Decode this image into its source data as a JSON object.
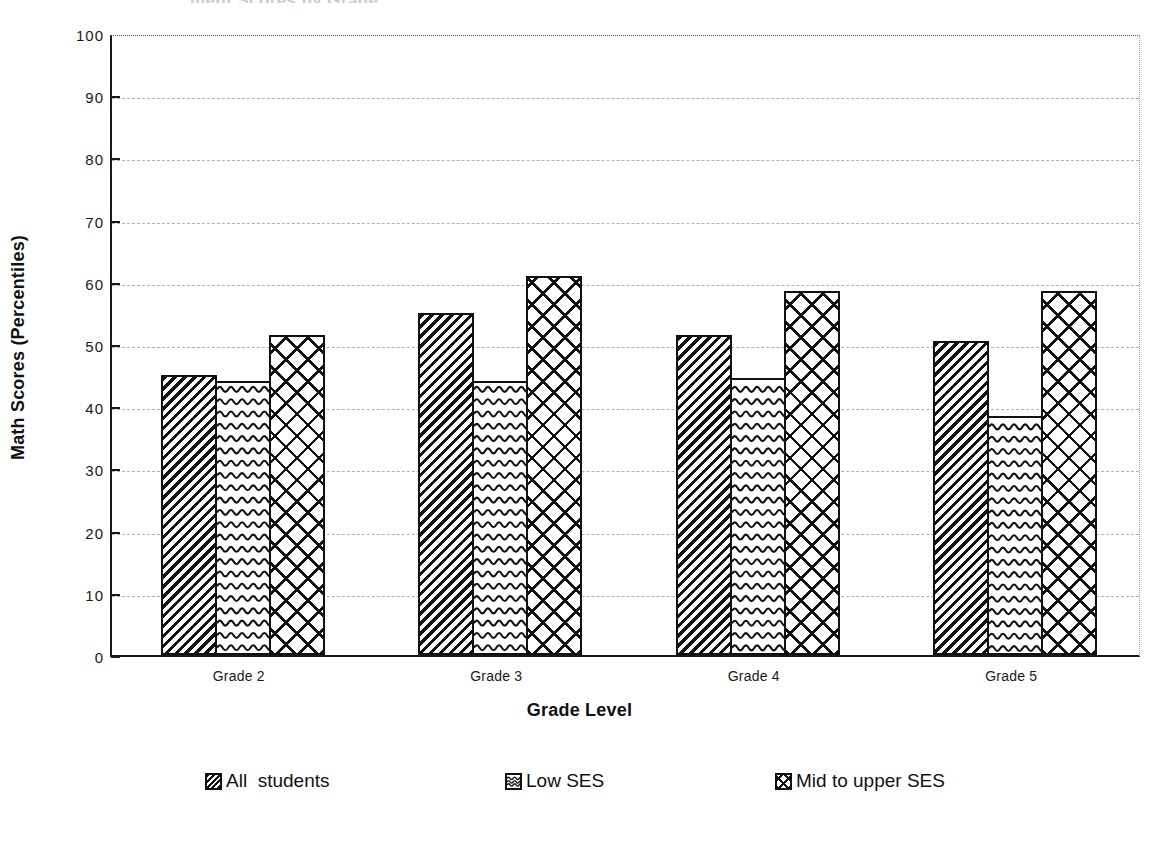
{
  "chart_data": {
    "type": "bar",
    "title": "",
    "xlabel": "Grade Level",
    "ylabel": "Math Scores (Percentiles)",
    "categories": [
      "Grade 2",
      "Grade 3",
      "Grade 4",
      "Grade 5"
    ],
    "series": [
      {
        "name": "All  students",
        "pattern": "diagonal-hatch",
        "values": [
          45,
          55,
          51.5,
          50.5
        ]
      },
      {
        "name": "Low SES",
        "pattern": "wavy-lines",
        "values": [
          44,
          44,
          44.5,
          38.5
        ]
      },
      {
        "name": "Mid to upper SES",
        "pattern": "crosshatch",
        "values": [
          51.5,
          61,
          58.5,
          58.5
        ]
      }
    ],
    "ylim": [
      0,
      100
    ],
    "yticks": [
      0,
      10,
      20,
      30,
      40,
      50,
      60,
      70,
      80,
      90,
      100
    ],
    "ytick_labels": [
      "0",
      "10",
      "20",
      "30",
      "40",
      "50",
      "60",
      "70",
      "80",
      "90",
      "100"
    ],
    "grid": true,
    "grid_axis": "y",
    "legend_position": "bottom",
    "colors": {
      "ink": "#111111",
      "grid": "#b0b0b6",
      "background": "#ffffff"
    }
  },
  "cropped_title_ghost": "ment Scores by Grade"
}
